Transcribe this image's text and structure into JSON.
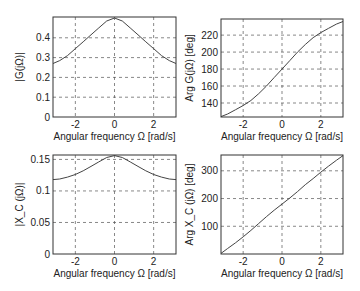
{
  "chart_data": [
    {
      "type": "line",
      "id": "mag-G",
      "title": "",
      "xlabel": "Angular frequency Ω [rad/s]",
      "ylabel": "|G(jΩ)|",
      "xlim": [
        -3.1416,
        3.1416
      ],
      "ylim": [
        0,
        0.505
      ],
      "xticks": [
        -2,
        0,
        2
      ],
      "xtick_labels": [
        "-2",
        "0",
        "2"
      ],
      "yticks": [
        0,
        0.1,
        0.2,
        0.3,
        0.4
      ],
      "ytick_labels": [
        "0",
        "0.1",
        "0.2",
        "0.3",
        "0.4"
      ],
      "grid": true,
      "box": {
        "x": 53,
        "y": 17,
        "w": 123,
        "h": 100
      },
      "series": [
        {
          "name": "|G(jΩ)|",
          "x": [
            -3.1416,
            -2.8,
            -2.4,
            -2.0,
            -1.6,
            -1.2,
            -0.8,
            -0.4,
            0,
            0.4,
            0.8,
            1.2,
            1.6,
            2.0,
            2.4,
            2.8,
            3.1416
          ],
          "values": [
            0.27,
            0.285,
            0.31,
            0.345,
            0.38,
            0.415,
            0.45,
            0.485,
            0.5,
            0.485,
            0.45,
            0.415,
            0.38,
            0.345,
            0.31,
            0.285,
            0.27
          ]
        }
      ]
    },
    {
      "type": "line",
      "id": "arg-G",
      "title": "",
      "xlabel": "Angular frequency Ω [rad/s]",
      "ylabel": "Arg G(jΩ) [deg]",
      "xlim": [
        -3.1416,
        3.1416
      ],
      "ylim": [
        123.5,
        239
      ],
      "xticks": [
        -2,
        0,
        2
      ],
      "xtick_labels": [
        "-2",
        "0",
        "2"
      ],
      "yticks": [
        140,
        160,
        180,
        200,
        220
      ],
      "ytick_labels": [
        "140",
        "160",
        "180",
        "200",
        "220"
      ],
      "grid": true,
      "box": {
        "x": 221,
        "y": 19,
        "w": 122,
        "h": 98
      },
      "series": [
        {
          "name": "Arg G(jΩ)",
          "x": [
            -3.1416,
            -2.8,
            -2.4,
            -2.0,
            -1.6,
            -1.2,
            -0.8,
            -0.4,
            0,
            0.4,
            0.8,
            1.2,
            1.6,
            2.0,
            2.4,
            2.8,
            3.1416
          ],
          "values": [
            124,
            127,
            132,
            137,
            143,
            151,
            160,
            170,
            180,
            190,
            200,
            209,
            217,
            223,
            228,
            233,
            236
          ]
        }
      ]
    },
    {
      "type": "line",
      "id": "mag-Xc",
      "title": "",
      "xlabel": "Angular frequency Ω [rad/s]",
      "ylabel": "|X_C (jΩ)|",
      "xlim": [
        -3.1416,
        3.1416
      ],
      "ylim": [
        0,
        0.157
      ],
      "xticks": [
        -2,
        0,
        2
      ],
      "xtick_labels": [
        "-2",
        "0",
        "2"
      ],
      "yticks": [
        0,
        0.05,
        0.1,
        0.15
      ],
      "ytick_labels": [
        "0",
        "0.05",
        "0.1",
        "0.15"
      ],
      "grid": true,
      "box": {
        "x": 53,
        "y": 155,
        "w": 123,
        "h": 99
      },
      "series": [
        {
          "name": "|X_C(jΩ)|",
          "x": [
            -3.1416,
            -2.8,
            -2.4,
            -2.0,
            -1.6,
            -1.2,
            -0.8,
            -0.4,
            0,
            0.4,
            0.8,
            1.2,
            1.6,
            2.0,
            2.4,
            2.8,
            3.1416
          ],
          "values": [
            0.118,
            0.119,
            0.122,
            0.126,
            0.132,
            0.139,
            0.146,
            0.153,
            0.156,
            0.153,
            0.146,
            0.139,
            0.132,
            0.126,
            0.122,
            0.119,
            0.118
          ]
        }
      ]
    },
    {
      "type": "line",
      "id": "arg-Xc",
      "title": "",
      "xlabel": "Angular frequency Ω [rad/s]",
      "ylabel": "Arg X_C (jΩ) [deg]",
      "xlim": [
        -3.1416,
        3.1416
      ],
      "ylim": [
        0,
        357
      ],
      "xticks": [
        -2,
        0,
        2
      ],
      "xtick_labels": [
        "-2",
        "0",
        "2"
      ],
      "yticks": [
        100,
        200,
        300
      ],
      "ytick_labels": [
        "100",
        "200",
        "300"
      ],
      "grid": true,
      "box": {
        "x": 221,
        "y": 155,
        "w": 122,
        "h": 99
      },
      "series": [
        {
          "name": "Arg X_C(jΩ)",
          "x": [
            -3.1416,
            -2.8,
            -2.4,
            -2.0,
            -1.6,
            -1.2,
            -0.8,
            -0.4,
            0,
            0.4,
            0.8,
            1.2,
            1.6,
            2.0,
            2.4,
            2.8,
            3.1416
          ],
          "values": [
            2,
            20,
            40,
            62,
            85,
            110,
            135,
            158,
            180,
            202,
            225,
            250,
            272,
            295,
            317,
            338,
            355
          ]
        }
      ]
    }
  ]
}
